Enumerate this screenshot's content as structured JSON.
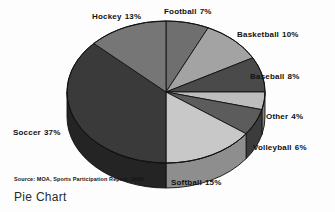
{
  "caption": "Pie Chart",
  "source_note": "Source: MOA, Sports Participation Report, 2005.",
  "chart_data": {
    "type": "pie",
    "title": "Pie Chart",
    "xlabel": "",
    "ylabel": "",
    "source": "Source: MOA, Sports Participation Report, 2005.",
    "units": "percent",
    "total": 100,
    "start_angle_deg": 0,
    "direction": "clockwise",
    "style": "3d-grayscale",
    "legend": "none-labels-outside",
    "grid": false,
    "categories": [
      "Football",
      "Basketball",
      "Baseball",
      "Other",
      "Volleyball",
      "Softball",
      "Soccer",
      "Hockey"
    ],
    "values": [
      7,
      10,
      8,
      4,
      6,
      15,
      37,
      13
    ],
    "slices": [
      {
        "label": "Football",
        "value": 7,
        "value_text": "7%",
        "color": "#6f6f6f",
        "side_color": "#4d4d4d"
      },
      {
        "label": "Basketball",
        "value": 10,
        "value_text": "10%",
        "color": "#a3a3a3",
        "side_color": "#6e6e6e"
      },
      {
        "label": "Baseball",
        "value": 8,
        "value_text": "8%",
        "color": "#4a4a4a",
        "side_color": "#303030"
      },
      {
        "label": "Other",
        "value": 4,
        "value_text": "4%",
        "color": "#bdbdbd",
        "side_color": "#848484"
      },
      {
        "label": "Volleyball",
        "value": 6,
        "value_text": "6%",
        "color": "#5c5c5c",
        "side_color": "#3c3c3c"
      },
      {
        "label": "Softball",
        "value": 15,
        "value_text": "15%",
        "color": "#c8c8c8",
        "side_color": "#8e8e8e"
      },
      {
        "label": "Soccer",
        "value": 37,
        "value_text": "37%",
        "color": "#3a3a3a",
        "side_color": "#242424"
      },
      {
        "label": "Hockey",
        "value": 13,
        "value_text": "13%",
        "color": "#767676",
        "side_color": "#4f4f4f"
      }
    ]
  },
  "labels": {
    "hockey": {
      "name": "Hockey",
      "pct": "13%"
    },
    "football": {
      "name": "Football",
      "pct": "7%"
    },
    "basketball": {
      "name": "Basketball",
      "pct": "10%"
    },
    "baseball": {
      "name": "Baseball",
      "pct": "8%"
    },
    "other": {
      "name": "Other",
      "pct": "4%"
    },
    "volleyball": {
      "name": "Volleyball",
      "pct": "6%"
    },
    "softball": {
      "name": "Softball",
      "pct": "15%"
    },
    "soccer": {
      "name": "Soccer",
      "pct": "37%"
    }
  }
}
